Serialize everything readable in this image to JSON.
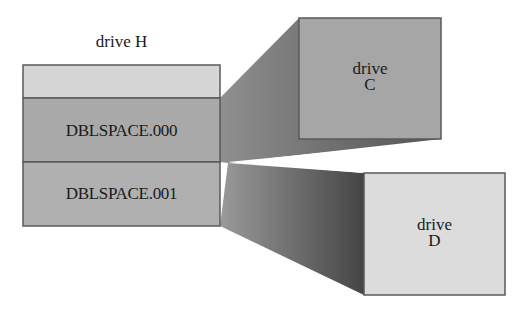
{
  "diagram": {
    "host_drive": {
      "title": "drive H",
      "segments": [
        {
          "id": "free",
          "label": "",
          "fill": "#d6d6d6"
        },
        {
          "id": "cvf0",
          "label": "DBLSPACE.000",
          "fill": "#a9a9a9"
        },
        {
          "id": "cvf1",
          "label": "DBLSPACE.001",
          "fill": "#b0b0b0"
        }
      ]
    },
    "mapped_drives": [
      {
        "id": "C",
        "line1": "drive",
        "line2": "C",
        "source": "DBLSPACE.000",
        "fill": "#a6a6a6"
      },
      {
        "id": "D",
        "line1": "drive",
        "line2": "D",
        "source": "DBLSPACE.001",
        "fill": "#dcdcdc"
      }
    ],
    "colors": {
      "border": "#5a5a5a",
      "shadow_dark": "#4a4a4a",
      "shadow_light": "#8c8c8c",
      "background": "#ffffff"
    }
  }
}
